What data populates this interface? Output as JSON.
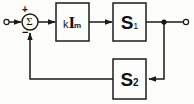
{
  "diagram": {
    "kind": "block-diagram",
    "colors": {
      "line": "#1a1a1a",
      "box_stroke": "#1d1d1d",
      "background": "#fdfdfc",
      "text": "#131313"
    },
    "terminals": [
      {
        "id": "input-terminal",
        "label": "",
        "shape": "open-circle",
        "x": 6,
        "y": 22
      },
      {
        "id": "output-terminal",
        "label": "",
        "shape": "open-circle",
        "x": 186,
        "y": 22
      }
    ],
    "summing_junction": {
      "name": "summing-junction",
      "symbol": "Σ",
      "plus_sign": "+",
      "minus_sign": "−",
      "cx": 30,
      "cy": 22,
      "r": 8
    },
    "blocks": [
      {
        "id": "gain-block",
        "label_full": "kIₘ",
        "label_main": "k",
        "label_bold": "I",
        "label_sub": "m",
        "x": 56,
        "y": 3,
        "w": 33,
        "h": 38
      },
      {
        "id": "s1-block",
        "label_full": "S₁",
        "label_main": "S",
        "label_sub": "1",
        "x": 113,
        "y": 3,
        "w": 33,
        "h": 38
      },
      {
        "id": "s2-block",
        "label_full": "S₂",
        "label_main": "S",
        "label_sub": "2",
        "x": 113,
        "y": 59,
        "w": 33,
        "h": 40
      }
    ],
    "junction_dot": {
      "name": "output-tap-junction",
      "x": 164,
      "y": 22,
      "r": 2.4
    },
    "signal_paths": [
      {
        "id": "input-to-sum",
        "from": "input-terminal",
        "to": "summing-junction",
        "arrow": true
      },
      {
        "id": "sum-to-gain",
        "from": "summing-junction",
        "to": "gain-block",
        "arrow": true
      },
      {
        "id": "gain-to-s1",
        "from": "gain-block",
        "to": "s1-block",
        "arrow": true
      },
      {
        "id": "s1-to-output",
        "from": "s1-block",
        "to": "output-terminal",
        "arrow": false
      },
      {
        "id": "tap-to-s2",
        "from": "output-tap-junction",
        "to": "s2-block",
        "arrow": true
      },
      {
        "id": "s2-to-sum",
        "from": "s2-block",
        "to": "summing-junction",
        "arrow": true
      }
    ]
  }
}
